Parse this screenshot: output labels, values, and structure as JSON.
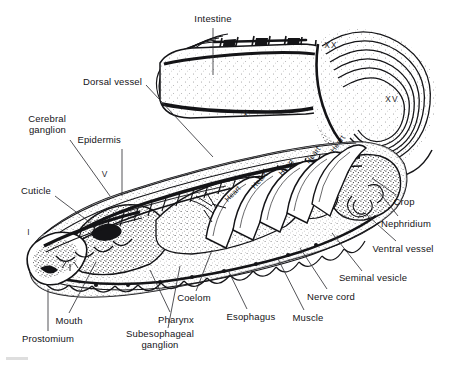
{
  "figure": {
    "style": "black-and-white stippled line engraving",
    "width": 460,
    "height": 369,
    "background_color": "#ffffff",
    "ink_color": "#141417"
  },
  "labels": [
    {
      "id": "intestine",
      "text": "Intestine",
      "x": 213,
      "y": 18,
      "align": "center",
      "leader_to": [
        213,
        75
      ]
    },
    {
      "id": "dorsal-vessel",
      "text": "Dorsal vessel",
      "x": 142,
      "y": 81,
      "align": "right",
      "leader_to": [
        213,
        157
      ]
    },
    {
      "id": "cerebral-ganglion",
      "text": "Cerebral\nganglion",
      "x": 66,
      "y": 118,
      "align": "right",
      "leader_to": [
        110,
        196
      ]
    },
    {
      "id": "epidermis",
      "text": "Epidermis",
      "x": 121,
      "y": 139,
      "align": "right",
      "leader_to": [
        121,
        196
      ]
    },
    {
      "id": "cuticle",
      "text": "Cuticle",
      "x": 51,
      "y": 190,
      "align": "right",
      "leader_to": [
        92,
        224
      ]
    },
    {
      "id": "mouth",
      "text": "Mouth",
      "x": 69,
      "y": 320,
      "align": "center",
      "leader_to": [
        96,
        260
      ]
    },
    {
      "id": "prostomium",
      "text": "Prostomium",
      "x": 48,
      "y": 338,
      "align": "center",
      "leader_to": [
        48,
        287
      ]
    },
    {
      "id": "subesophageal-ganglion",
      "text": "Subesophageal\nganglion",
      "x": 160,
      "y": 333,
      "align": "center",
      "leader_to": [
        178,
        264
      ]
    },
    {
      "id": "pharynx",
      "text": "Pharynx",
      "x": 176,
      "y": 319,
      "align": "center",
      "leader_to": [
        150,
        268
      ]
    },
    {
      "id": "coelom",
      "text": "Coelom",
      "x": 194,
      "y": 297,
      "align": "center",
      "leader_to": [
        210,
        248
      ]
    },
    {
      "id": "esophagus",
      "text": "Esophagus",
      "x": 251,
      "y": 316,
      "align": "center",
      "leader_to": [
        228,
        268
      ]
    },
    {
      "id": "muscle",
      "text": "Muscle",
      "x": 308,
      "y": 317,
      "align": "center",
      "leader_to": [
        277,
        255
      ]
    },
    {
      "id": "nerve-cord",
      "text": "Nerve cord",
      "x": 331,
      "y": 296,
      "align": "center",
      "leader_to": [
        300,
        246
      ]
    },
    {
      "id": "seminal-vesicle",
      "text": "Seminal vesicle",
      "x": 373,
      "y": 277,
      "align": "center",
      "leader_to": [
        332,
        231
      ]
    },
    {
      "id": "ventral-vessel",
      "text": "Ventral vessel",
      "x": 403,
      "y": 248,
      "align": "center",
      "leader_to": [
        367,
        213
      ]
    },
    {
      "id": "nephridium",
      "text": "Nephridium",
      "x": 406,
      "y": 223,
      "align": "center",
      "leader_to": [
        379,
        190
      ]
    },
    {
      "id": "crop",
      "text": "Crop",
      "x": 404,
      "y": 201,
      "align": "center",
      "leader_to": [
        372,
        176
      ]
    }
  ],
  "segment_markers": [
    {
      "id": "segment-i",
      "text": "I",
      "x": 29,
      "y": 232
    },
    {
      "id": "segment-v",
      "text": "V",
      "x": 105,
      "y": 174
    },
    {
      "id": "segment-x",
      "text": "X",
      "x": 246,
      "y": 114
    },
    {
      "id": "segment-xx",
      "text": "XX",
      "x": 331,
      "y": 45
    },
    {
      "id": "segment-xv",
      "text": "XV",
      "x": 392,
      "y": 99
    }
  ],
  "heart_labels": [
    {
      "id": "heart-1",
      "text": "Heart",
      "x": 226,
      "y": 196,
      "rotate": -46
    },
    {
      "id": "heart-2",
      "text": "Heart",
      "x": 253,
      "y": 183,
      "rotate": -48
    },
    {
      "id": "heart-3",
      "text": "Heart",
      "x": 280,
      "y": 170,
      "rotate": -50
    },
    {
      "id": "heart-4",
      "text": "Heart",
      "x": 307,
      "y": 158,
      "rotate": -52
    },
    {
      "id": "heart-5",
      "text": "Heart",
      "x": 332,
      "y": 147,
      "rotate": -54
    }
  ]
}
